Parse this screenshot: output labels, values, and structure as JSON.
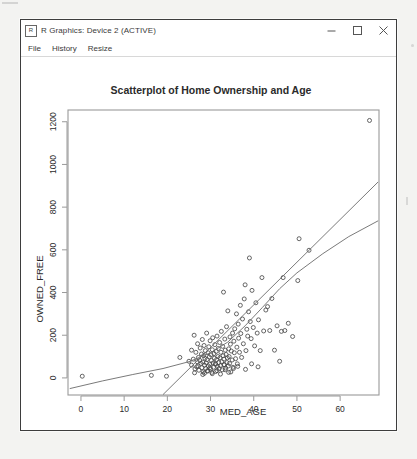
{
  "window": {
    "title": "R Graphics: Device 2 (ACTIVE)",
    "app_icon": "r-graphics-icon",
    "controls": {
      "minimize": "minimize-icon",
      "maximize": "maximize-icon",
      "close": "close-icon"
    }
  },
  "menubar": {
    "items": [
      {
        "label": "File"
      },
      {
        "label": "History"
      },
      {
        "label": "Resize"
      }
    ]
  },
  "chart_data": {
    "type": "scatter",
    "title": "Scatterplot of Home Ownership and Age",
    "xlabel": "MED_AGE",
    "ylabel": "OWNED_FREE",
    "xlim": [
      -3,
      69
    ],
    "ylim": [
      -80,
      1255
    ],
    "xticks": [
      0,
      10,
      20,
      30,
      40,
      50,
      60
    ],
    "yticks": [
      0,
      200,
      400,
      600,
      800,
      1000,
      1200
    ],
    "grid": false,
    "legend": null,
    "point_style": {
      "marker": "open-circle",
      "radius": 2.0,
      "color": "#4a4a4a"
    },
    "series": [
      {
        "name": "observations",
        "x": [
          0.3,
          16.3,
          19.8,
          22.9,
          25.0,
          25.6,
          25.6,
          26.0,
          26.2,
          26.4,
          26.6,
          26.8,
          27.0,
          27.2,
          27.3,
          27.5,
          27.6,
          27.8,
          27.9,
          28.0,
          28.1,
          28.2,
          28.3,
          28.4,
          28.5,
          28.6,
          28.7,
          28.8,
          28.9,
          29.0,
          29.1,
          29.2,
          29.3,
          29.4,
          29.5,
          29.6,
          29.7,
          29.8,
          29.9,
          30.0,
          30.1,
          30.2,
          30.3,
          30.4,
          30.5,
          30.6,
          30.7,
          30.8,
          30.9,
          31.0,
          31.1,
          31.2,
          31.3,
          31.4,
          31.5,
          31.6,
          31.7,
          31.8,
          31.9,
          32.0,
          32.1,
          32.2,
          32.3,
          32.4,
          32.5,
          32.6,
          32.7,
          32.8,
          32.9,
          33.0,
          33.1,
          33.2,
          33.3,
          33.4,
          33.5,
          33.6,
          33.7,
          33.8,
          33.9,
          34.0,
          34.1,
          34.2,
          34.3,
          34.4,
          34.5,
          34.6,
          34.8,
          35.0,
          35.1,
          35.2,
          35.4,
          35.5,
          35.6,
          35.8,
          36.0,
          36.1,
          36.2,
          36.4,
          36.5,
          36.7,
          36.9,
          37.0,
          37.2,
          37.4,
          37.6,
          37.8,
          38.0,
          38.2,
          38.4,
          38.6,
          38.8,
          39.0,
          39.2,
          39.4,
          39.6,
          39.9,
          40.2,
          40.5,
          40.8,
          41.1,
          41.5,
          41.9,
          42.3,
          42.8,
          43.2,
          43.7,
          44.2,
          44.8,
          45.4,
          46.0,
          46.4,
          46.8,
          47.2,
          48.0,
          49.0,
          50.2,
          50.5,
          52.8,
          66.8,
          26.3,
          27.1,
          28.2,
          29.3,
          30.4,
          31.2,
          32.3,
          33.4,
          34.2,
          35.3,
          26.9,
          28.6,
          29.9,
          31.5,
          33.1,
          34.7,
          36.3,
          38.1,
          39.5,
          41.0
        ],
        "y": [
          8,
          12,
          8,
          96,
          78,
          130,
          60,
          88,
          200,
          42,
          120,
          52,
          160,
          96,
          36,
          82,
          140,
          68,
          112,
          48,
          180,
          74,
          28,
          104,
          152,
          60,
          92,
          128,
          44,
          70,
          210,
          86,
          34,
          118,
          56,
          146,
          98,
          64,
          174,
          40,
          108,
          82,
          26,
          132,
          188,
          70,
          50,
          114,
          92,
          156,
          66,
          30,
          124,
          86,
          196,
          54,
          100,
          138,
          72,
          44,
          166,
          94,
          58,
          120,
          218,
          76,
          38,
          148,
          104,
          402,
          88,
          62,
          182,
          130,
          46,
          110,
          240,
          72,
          94,
          314,
          56,
          136,
          100,
          68,
          192,
          158,
          126,
          84,
          210,
          50,
          172,
          118,
          230,
          90,
          300,
          144,
          66,
          252,
          186,
          120,
          340,
          208,
          96,
          276,
          160,
          370,
          436,
          128,
          228,
          196,
          310,
          562,
          264,
          184,
          410,
          236,
          150,
          352,
          210,
          272,
          128,
          470,
          220,
          318,
          334,
          222,
          372,
          130,
          244,
          78,
          218,
          470,
          222,
          256,
          194,
          456,
          652,
          598,
          1206,
          24,
          56,
          16,
          32,
          20,
          64,
          18,
          38,
          26,
          44,
          76,
          22,
          48,
          34,
          62,
          28,
          54,
          40,
          66,
          52
        ]
      }
    ],
    "fits": [
      {
        "name": "linear-fit",
        "type": "line",
        "x": [
          19.0,
          68.8
        ],
        "y": [
          -78,
          918
        ]
      },
      {
        "name": "smooth-fit",
        "type": "curve",
        "x": [
          -2.6,
          5,
          12,
          19,
          25,
          30,
          34,
          38,
          42,
          46,
          50,
          56,
          62,
          68.8
        ],
        "y": [
          -50,
          -14,
          16,
          44,
          76,
          118,
          168,
          244,
          330,
          418,
          492,
          582,
          662,
          736
        ]
      }
    ]
  }
}
